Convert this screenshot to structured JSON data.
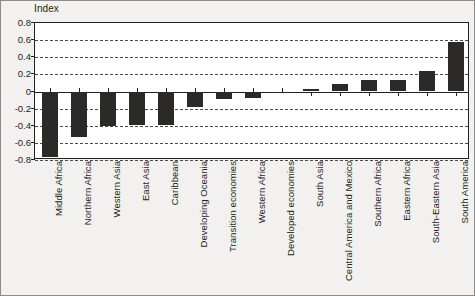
{
  "axis_unit_label": "Index",
  "colors": {
    "bar": "#2c2a29",
    "background": "#f2f1ef",
    "plot_background": "#ffffff",
    "axis": "#231f20",
    "gridline": "#4a4a4a",
    "frame_border": "#8c8c8c"
  },
  "chart_data": {
    "type": "bar",
    "title": "",
    "subtitle": "",
    "xlabel": "",
    "ylabel": "Index",
    "ylim": [
      -0.8,
      0.8
    ],
    "yticks": [
      "0.8",
      "0.6",
      "0.4",
      "0.2",
      "0",
      "-0.2",
      "-0.4",
      "-0.6",
      "-0.8"
    ],
    "ytick_values": [
      0.8,
      0.6,
      0.4,
      0.2,
      0,
      -0.2,
      -0.4,
      -0.6,
      -0.8
    ],
    "grid": true,
    "legend": false,
    "legend_position": "none",
    "categories": [
      "Middle Africa",
      "Northern Africa",
      "Western Asia",
      "East Asia",
      "Caribbean",
      "Developing Oceania",
      "Transition economies",
      "Western Africa",
      "Developed economies",
      "South Asia",
      "Central America and Mexico",
      "Southern Africa",
      "Eastern Africa",
      "South-Eastern Asia",
      "South America"
    ],
    "values": [
      -0.77,
      -0.53,
      -0.4,
      -0.39,
      -0.39,
      -0.18,
      -0.09,
      -0.08,
      -0.01,
      0.03,
      0.09,
      0.13,
      0.13,
      0.24,
      0.58
    ]
  }
}
